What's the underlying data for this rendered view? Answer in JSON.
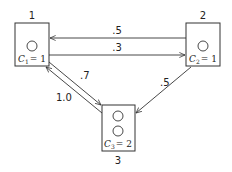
{
  "diagram": {
    "type": "state-transition",
    "nodes": [
      {
        "id": "1",
        "label": "1",
        "capacity_label": "C",
        "capacity_sub": "1",
        "capacity_value": "= 1",
        "circles": 1
      },
      {
        "id": "2",
        "label": "2",
        "capacity_label": "C",
        "capacity_sub": "2",
        "capacity_value": "= 1",
        "circles": 1
      },
      {
        "id": "3",
        "label": "3",
        "capacity_label": "C",
        "capacity_sub": "3",
        "capacity_value": "= 2",
        "circles": 2
      }
    ],
    "edges": [
      {
        "from": "2",
        "to": "1",
        "weight": ".5"
      },
      {
        "from": "1",
        "to": "2",
        "weight": ".3"
      },
      {
        "from": "1",
        "to": "3",
        "weight": ".7"
      },
      {
        "from": "3",
        "to": "1",
        "weight": "1.0"
      },
      {
        "from": "2",
        "to": "3",
        "weight": ".5"
      }
    ],
    "colors": {
      "stroke": "#333333",
      "background": "#ffffff"
    }
  }
}
